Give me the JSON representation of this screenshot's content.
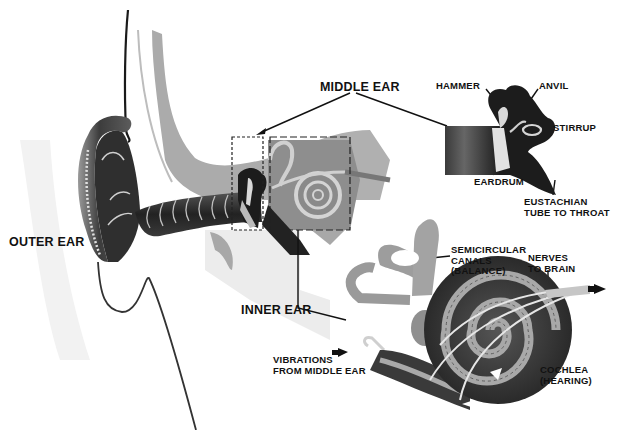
{
  "diagram": {
    "type": "anatomical-illustration",
    "colors": {
      "background": "#ffffff",
      "tissue_light": "#b4b4b4",
      "tissue_mid": "#7a7a7a",
      "dark": "#1e1e1e",
      "bone": "#d6d6d6",
      "label": "#111111"
    }
  },
  "labels": {
    "outer_ear": "OUTER EAR",
    "middle_ear": "MIDDLE EAR",
    "inner_ear": "INNER EAR",
    "hammer": "HAMMER",
    "anvil": "ANVIL",
    "stirrup": "STIRRUP",
    "eardrum": "EARDRUM",
    "eustachian": "EUSTACHIAN\nTUBE TO THROAT",
    "semicircular": "SEMICIRCULAR\nCANALS\n(BALANCE)",
    "nerves": "NERVES\nTO BRAIN",
    "cochlea": "COCHLEA\n(HEARING)",
    "vibrations": "VIBRATIONS\nFROM MIDDLE EAR"
  },
  "regions": [
    {
      "name": "outer-ear",
      "label": "OUTER EAR"
    },
    {
      "name": "middle-ear",
      "label": "MIDDLE EAR",
      "parts": [
        "HAMMER",
        "ANVIL",
        "STIRRUP",
        "EARDRUM",
        "EUSTACHIAN TUBE TO THROAT"
      ]
    },
    {
      "name": "inner-ear",
      "label": "INNER EAR",
      "parts": [
        "SEMICIRCULAR CANALS (BALANCE)",
        "COCHLEA (HEARING)",
        "NERVES TO BRAIN"
      ]
    }
  ]
}
